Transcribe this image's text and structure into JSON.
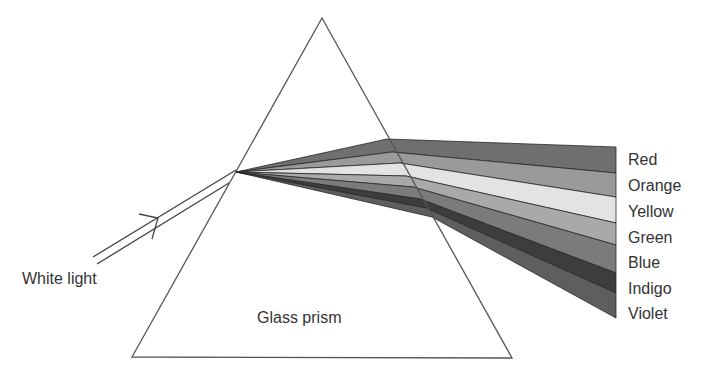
{
  "diagram": {
    "type": "prism-dispersion",
    "prism": {
      "label": "Glass prism",
      "apex": [
        322,
        18
      ],
      "bottom_left": [
        132,
        357
      ],
      "bottom_right": [
        512,
        358
      ],
      "stroke": "#555555"
    },
    "incident_light": {
      "label": "White light",
      "entry_point": [
        236,
        172
      ],
      "line1_start": [
        93,
        257
      ],
      "line2_start": [
        97,
        264
      ]
    },
    "spectrum": {
      "right_edge_x": 616,
      "bands": [
        {
          "name": "Red",
          "color": "#6f6f6f"
        },
        {
          "name": "Orange",
          "color": "#999999"
        },
        {
          "name": "Yellow",
          "color": "#e2e2e2"
        },
        {
          "name": "Green",
          "color": "#a8a8a8"
        },
        {
          "name": "Blue",
          "color": "#7a7a7a"
        },
        {
          "name": "Indigo",
          "color": "#3c3c3c"
        },
        {
          "name": "Violet",
          "color": "#5d5d5d"
        }
      ]
    }
  },
  "labels": {
    "white_light": "White light",
    "glass_prism": "Glass prism",
    "red": "Red",
    "orange": "Orange",
    "yellow": "Yellow",
    "green": "Green",
    "blue": "Blue",
    "indigo": "Indigo",
    "violet": "Violet"
  }
}
